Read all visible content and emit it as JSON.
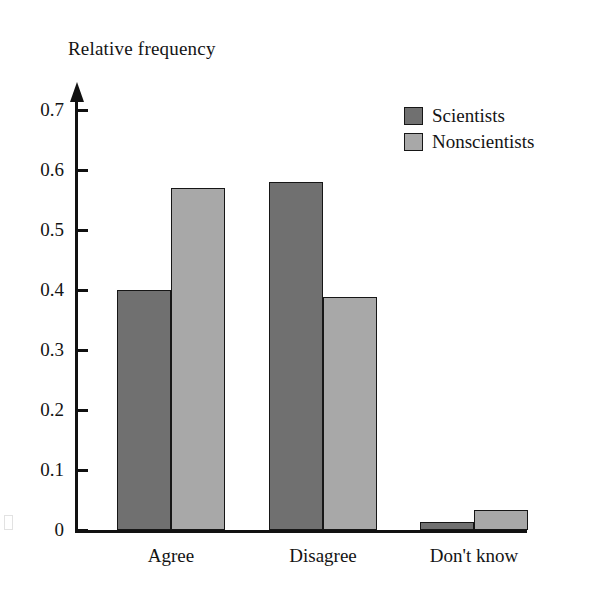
{
  "chart_data": {
    "type": "bar",
    "title": "",
    "ylabel": "Relative frequency",
    "xlabel": "",
    "categories": [
      "Agree",
      "Disagree",
      "Don't know"
    ],
    "series": [
      {
        "name": "Scientists",
        "color": "#707070",
        "values": [
          0.4,
          0.58,
          0.013
        ]
      },
      {
        "name": "Nonscientists",
        "color": "#a8a8a8",
        "values": [
          0.57,
          0.388,
          0.034
        ]
      }
    ],
    "ylim": [
      0,
      0.75
    ],
    "yticks": [
      0,
      0.1,
      0.2,
      0.3,
      0.4,
      0.5,
      0.6,
      0.7
    ],
    "ytick_labels": [
      "0",
      "0.1",
      "0.2",
      "0.3",
      "0.4",
      "0.5",
      "0.6",
      "0.7"
    ],
    "grid": false,
    "legend_position": "top-right",
    "bar_outline_color": "#161616",
    "axis_color": "#111111"
  },
  "legend": {
    "entries": [
      {
        "label": "Scientists",
        "color": "#707070"
      },
      {
        "label": "Nonscientists",
        "color": "#a8a8a8"
      }
    ]
  }
}
